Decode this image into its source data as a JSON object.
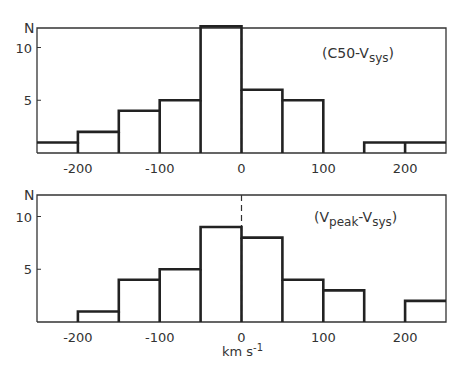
{
  "chart_data": [
    {
      "type": "bar",
      "subtype": "histogram-step",
      "title": "(C50-Vsys)",
      "label_main": "(C50-V",
      "label_sub": "sys",
      "label_close": ")",
      "xlabel": "",
      "ylabel": "N",
      "bin_edges": [
        -250,
        -200,
        -150,
        -100,
        -50,
        0,
        50,
        100,
        150,
        200,
        250
      ],
      "categories": [
        "-250..-200",
        "-200..-150",
        "-150..-100",
        "-100..-50",
        "-50..0",
        "0..50",
        "50..100",
        "100..150",
        "150..200",
        "200..250"
      ],
      "values": [
        1,
        2,
        4,
        5,
        12,
        6,
        5,
        0,
        1,
        1
      ],
      "xlim": [
        -250,
        250
      ],
      "ylim": [
        0,
        12
      ],
      "xticks": [
        "-200",
        "-100",
        "0",
        "100",
        "200"
      ],
      "yticks": [
        "5",
        "10"
      ],
      "grid": false,
      "zero_line": "dashed"
    },
    {
      "type": "bar",
      "subtype": "histogram-step",
      "title": "(Vpeak-Vsys)",
      "label_open": "(V",
      "label_sub1": "peak",
      "label_mid": "-V",
      "label_sub2": "sys",
      "label_close": ")",
      "xlabel": "km s-1",
      "ylabel": "N",
      "bin_edges": [
        -250,
        -200,
        -150,
        -100,
        -50,
        0,
        50,
        100,
        150,
        200,
        250
      ],
      "categories": [
        "-250..-200",
        "-200..-150",
        "-150..-100",
        "-100..-50",
        "-50..0",
        "0..50",
        "50..100",
        "100..150",
        "150..200",
        "200..250"
      ],
      "values": [
        0,
        1,
        4,
        5,
        9,
        8,
        4,
        3,
        0,
        2
      ],
      "xlim": [
        -250,
        250
      ],
      "ylim": [
        0,
        12
      ],
      "xticks": [
        "-200",
        "-100",
        "0",
        "100",
        "200"
      ],
      "yticks": [
        "5",
        "10"
      ],
      "grid": false,
      "zero_line": "dashed"
    }
  ],
  "axis": {
    "n_label": "N",
    "unit_main": "km s",
    "unit_sup": "-1"
  }
}
